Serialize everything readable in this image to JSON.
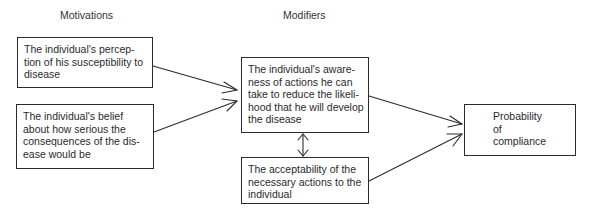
{
  "headings": {
    "motivations": "Motivations",
    "modifiers": "Modifiers"
  },
  "motivations": [
    {
      "id": "perceived-susceptibility",
      "lines": [
        "The individual's percep-",
        "tion of his susceptibility to",
        "disease"
      ]
    },
    {
      "id": "perceived-seriousness",
      "lines": [
        "The individual's belief",
        "about how serious the",
        "consequences of the dis-",
        "ease would be"
      ]
    }
  ],
  "modifiers": [
    {
      "id": "awareness-of-actions",
      "lines": [
        "The individual's aware-",
        "ness of actions he can",
        "take to reduce the likeli-",
        "hood that he will develop",
        "the disease"
      ]
    },
    {
      "id": "acceptability-of-actions",
      "lines": [
        "The acceptability of the",
        "necessary actions to the",
        "individual"
      ]
    }
  ],
  "outcome": {
    "id": "probability-of-compliance",
    "lines": [
      "Probability",
      "of",
      "compliance"
    ]
  },
  "connections": [
    {
      "from": "perceived-susceptibility",
      "to": "awareness-of-actions",
      "type": "arrow"
    },
    {
      "from": "perceived-seriousness",
      "to": "awareness-of-actions",
      "type": "arrow"
    },
    {
      "from": "awareness-of-actions",
      "to": "acceptability-of-actions",
      "type": "double-arrow"
    },
    {
      "from": "awareness-of-actions",
      "to": "probability-of-compliance",
      "type": "arrow"
    },
    {
      "from": "acceptability-of-actions",
      "to": "probability-of-compliance",
      "type": "arrow"
    }
  ],
  "colors": {
    "line": "#2b2b2b",
    "text": "#2a2a2a",
    "background": "#ffffff"
  }
}
